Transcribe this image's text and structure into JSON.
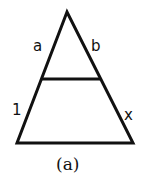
{
  "diagram": {
    "type": "triangle-with-parallel-segment",
    "caption": "(a)",
    "labels": {
      "upper_left_side": "a",
      "upper_right_side": "b",
      "lower_left_side": "1",
      "lower_right_side": "x"
    },
    "colors": {
      "stroke": "#111111",
      "background": "#ffffff"
    }
  }
}
